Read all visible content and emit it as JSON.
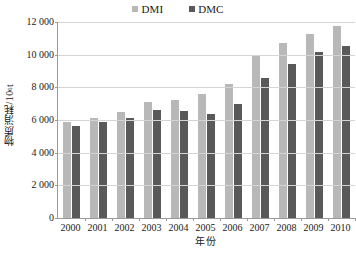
{
  "chart_data": {
    "type": "bar",
    "title": "",
    "xlabel": "年份",
    "ylabel": "物质消耗/10⁶ t",
    "ylabel_base": "物质消耗/10",
    "ylabel_exp": "6",
    "ylabel_unit": " t",
    "categories": [
      "2000",
      "2001",
      "2002",
      "2003",
      "2004",
      "2005",
      "2006",
      "2007",
      "2008",
      "2009",
      "2010"
    ],
    "series": [
      {
        "name": "DMI",
        "color": "#b8b8b8",
        "values": [
          5850,
          6100,
          6500,
          7100,
          7200,
          7600,
          8200,
          10000,
          10700,
          11250,
          11750
        ]
      },
      {
        "name": "DMC",
        "color": "#595959",
        "values": [
          5650,
          5850,
          6100,
          6600,
          6550,
          6350,
          7000,
          8550,
          9450,
          10150,
          10550
        ]
      }
    ],
    "ylim": [
      0,
      12000
    ],
    "yticks": [
      "0",
      "2 000",
      "4 000",
      "6 000",
      "8 000",
      "10 000",
      "12 000"
    ],
    "ytick_values": [
      0,
      2000,
      4000,
      6000,
      8000,
      10000,
      12000
    ],
    "grid": true,
    "legend_position": "top-center"
  }
}
